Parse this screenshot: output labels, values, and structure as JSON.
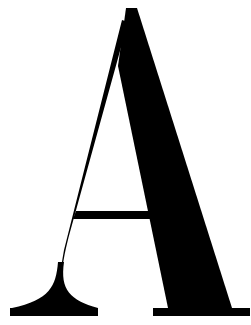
{
  "glyph": {
    "character": "A",
    "style": "serif",
    "case": "uppercase",
    "color": "#000000",
    "background": "#ffffff"
  }
}
